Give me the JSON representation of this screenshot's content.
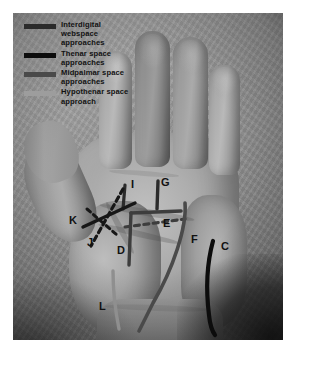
{
  "figure": {
    "type": "anatomical-photograph"
  },
  "legend": {
    "items": [
      {
        "label": "Interdigital\nwebspace\napproaches",
        "color": "#2b2b2b",
        "name": "interdigital-webspace-approaches"
      },
      {
        "label": "Thenar space\napproaches",
        "color": "#0d0d0d",
        "name": "thenar-space-approaches"
      },
      {
        "label": "Midpalmar space\napproaches",
        "color": "#4a4a4a",
        "name": "midpalmar-space-approaches"
      },
      {
        "label": "Hypothenar space\napproach",
        "color": "#9d9d9d",
        "name": "hypothenar-space-approach"
      }
    ]
  },
  "markers": [
    {
      "id": "C",
      "label": "C",
      "x": 208,
      "y": 232,
      "group": "hypothenar-space-approach"
    },
    {
      "id": "D",
      "label": "D",
      "x": 128,
      "y": 238,
      "group": "midpalmar-space-approaches"
    },
    {
      "id": "E",
      "label": "E",
      "x": 163,
      "y": 211,
      "group": "midpalmar-space-approaches"
    },
    {
      "id": "F",
      "label": "F",
      "x": 186,
      "y": 226,
      "group": "midpalmar-space-approaches"
    },
    {
      "id": "G",
      "label": "G",
      "x": 145,
      "y": 175,
      "group": "interdigital-webspace-approaches"
    },
    {
      "id": "I",
      "label": "I",
      "x": 120,
      "y": 173,
      "group": "interdigital-webspace-approaches"
    },
    {
      "id": "J",
      "label": "J",
      "x": 99,
      "y": 227,
      "group": "thenar-space-approaches"
    },
    {
      "id": "K",
      "label": "K",
      "x": 84,
      "y": 207,
      "group": "thenar-space-approaches"
    },
    {
      "id": "L",
      "label": "L",
      "x": 110,
      "y": 297,
      "group": "midpalmar-space-approaches"
    }
  ],
  "colors": {
    "line_dark": "#151515",
    "line_mid": "#3d3d3d",
    "line_light": "#8f8f8f",
    "label_text": "#111111",
    "plate_background": "#ffffff"
  }
}
